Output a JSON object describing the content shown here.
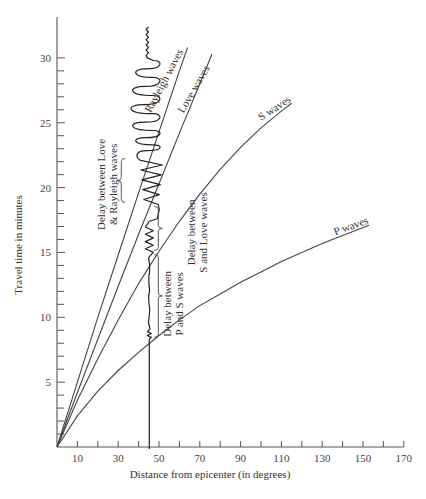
{
  "chart_data": {
    "type": "line",
    "title": "",
    "xlabel": "Distance from epicenter (in degrees)",
    "ylabel": "Travel time in minutes",
    "xlim": [
      0,
      170
    ],
    "ylim": [
      0,
      33
    ],
    "grid": false,
    "x_tick_labels": [
      "10",
      "30",
      "50",
      "70",
      "90",
      "110",
      "130",
      "150",
      "170"
    ],
    "x_tick_values": [
      10,
      30,
      50,
      70,
      90,
      110,
      130,
      150,
      170
    ],
    "x_minor_ticks": [
      10,
      20,
      30,
      40,
      50,
      60,
      70,
      80,
      90,
      100,
      110,
      120,
      130,
      140,
      150,
      160,
      170
    ],
    "y_tick_labels": [
      "5",
      "10",
      "15",
      "20",
      "25",
      "30"
    ],
    "y_tick_values": [
      5,
      10,
      15,
      20,
      25,
      30
    ],
    "y_minor_ticks": [
      1,
      2,
      3,
      4,
      5,
      6,
      7,
      8,
      9,
      10,
      11,
      12,
      13,
      14,
      15,
      16,
      17,
      18,
      19,
      20,
      21,
      22,
      23,
      24,
      25,
      26,
      27,
      28,
      29,
      30
    ],
    "series": [
      {
        "name": "Rayleigh waves",
        "label": "Rayleigh waves",
        "x": [
          0,
          10,
          20,
          30,
          40,
          50,
          60,
          64
        ],
        "y": [
          0,
          5.0,
          10.0,
          14.8,
          19.6,
          24.3,
          29.0,
          30.8
        ]
      },
      {
        "name": "Love waves",
        "label": "Love waves",
        "x": [
          0,
          10,
          20,
          30,
          40,
          50,
          60,
          70,
          76
        ],
        "y": [
          0,
          4.2,
          8.3,
          12.4,
          16.4,
          20.3,
          24.2,
          28.0,
          30.3
        ]
      },
      {
        "name": "S waves",
        "label": "S waves",
        "x": [
          0,
          10,
          20,
          30,
          40,
          50,
          60,
          70,
          80,
          90,
          100,
          110,
          115
        ],
        "y": [
          0,
          3.6,
          6.8,
          9.8,
          12.6,
          15.1,
          17.4,
          19.5,
          21.4,
          23.1,
          24.6,
          25.9,
          26.5
        ]
      },
      {
        "name": "P waves",
        "label": "P waves",
        "x": [
          0,
          10,
          20,
          30,
          40,
          50,
          60,
          70,
          80,
          90,
          100,
          110,
          120,
          130,
          140,
          153
        ],
        "y": [
          0,
          2.4,
          4.3,
          5.9,
          7.3,
          8.6,
          9.8,
          10.9,
          11.8,
          12.7,
          13.5,
          14.3,
          15.0,
          15.7,
          16.3,
          17.1
        ]
      }
    ],
    "seismogram": {
      "station_distance_deg": 45,
      "p_arrival_min": 8.3,
      "s_arrival_min": 15.0,
      "love_arrival_min": 18.7,
      "rayleigh_arrival_min": 22.4,
      "trace_end_min": 32.2
    },
    "annotations": [
      {
        "text_line1": "Delay between",
        "text_line2": "P and S waves",
        "from_min": 8.3,
        "to_min": 15.0
      },
      {
        "text_line1": "Delay between",
        "text_line2": "S and Love waves",
        "from_min": 15.0,
        "to_min": 18.7
      },
      {
        "text_line1": "Delay between Love",
        "text_line2": "& Rayleigh waves",
        "from_min": 18.7,
        "to_min": 22.4
      }
    ]
  }
}
